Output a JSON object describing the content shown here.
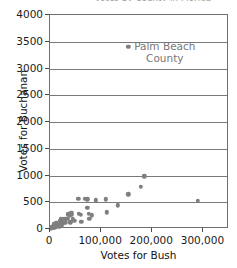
{
  "chart_data": {
    "type": "scatter",
    "title": "Votes by County in Florida",
    "xlabel": "Votes for Bush",
    "ylabel": "Votes for Buchanan",
    "xlim": [
      0,
      350000
    ],
    "ylim": [
      0,
      4000
    ],
    "xticks": [
      0,
      100000,
      200000,
      300000
    ],
    "xtick_labels": [
      "0",
      "100,000",
      "200,000",
      "300,000"
    ],
    "yticks": [
      0,
      500,
      1000,
      1500,
      2000,
      2500,
      3000,
      3500,
      4000
    ],
    "ytick_labels": [
      "0",
      "500",
      "1000",
      "1500",
      "2000",
      "2500",
      "3000",
      "3500",
      "4000"
    ],
    "grid": "horizontal",
    "legend": "none",
    "marker_color": "#7f7f7f",
    "annotations": [
      {
        "name": "palm-beach-county",
        "lines": [
          "Palm Beach",
          "County"
        ],
        "x": 152846,
        "y": 3407,
        "color": "#777777"
      }
    ],
    "points": [
      {
        "x": 1316,
        "y": 9
      },
      {
        "x": 2873,
        "y": 23
      },
      {
        "x": 3300,
        "y": 29
      },
      {
        "x": 4256,
        "y": 35
      },
      {
        "x": 4983,
        "y": 45
      },
      {
        "x": 5610,
        "y": 22
      },
      {
        "x": 6860,
        "y": 89
      },
      {
        "x": 8177,
        "y": 25
      },
      {
        "x": 9138,
        "y": 41
      },
      {
        "x": 10006,
        "y": 39
      },
      {
        "x": 12176,
        "y": 120
      },
      {
        "x": 12182,
        "y": 60
      },
      {
        "x": 12635,
        "y": 38
      },
      {
        "x": 16059,
        "y": 73
      },
      {
        "x": 17833,
        "y": 37
      },
      {
        "x": 19787,
        "y": 152
      },
      {
        "x": 20196,
        "y": 90
      },
      {
        "x": 21645,
        "y": 181
      },
      {
        "x": 23574,
        "y": 65
      },
      {
        "x": 24832,
        "y": 108
      },
      {
        "x": 25249,
        "y": 196
      },
      {
        "x": 29744,
        "y": 182
      },
      {
        "x": 29977,
        "y": 112
      },
      {
        "x": 34124,
        "y": 186
      },
      {
        "x": 35419,
        "y": 274
      },
      {
        "x": 38637,
        "y": 248
      },
      {
        "x": 39497,
        "y": 127
      },
      {
        "x": 41745,
        "y": 270
      },
      {
        "x": 41765,
        "y": 305
      },
      {
        "x": 44078,
        "y": 195
      },
      {
        "x": 47365,
        "y": 152
      },
      {
        "x": 55135,
        "y": 570
      },
      {
        "x": 56548,
        "y": 283
      },
      {
        "x": 60426,
        "y": 267
      },
      {
        "x": 61550,
        "y": 140
      },
      {
        "x": 68582,
        "y": 562
      },
      {
        "x": 73029,
        "y": 553
      },
      {
        "x": 73126,
        "y": 396
      },
      {
        "x": 75293,
        "y": 282
      },
      {
        "x": 76924,
        "y": 193
      },
      {
        "x": 82212,
        "y": 257
      },
      {
        "x": 89338,
        "y": 533
      },
      {
        "x": 108814,
        "y": 556
      },
      {
        "x": 111485,
        "y": 312
      },
      {
        "x": 133123,
        "y": 443
      },
      {
        "x": 152951,
        "y": 650
      },
      {
        "x": 176967,
        "y": 789
      },
      {
        "x": 184312,
        "y": 985
      },
      {
        "x": 289456,
        "y": 532
      },
      {
        "x": 152846,
        "y": 3407
      }
    ]
  }
}
